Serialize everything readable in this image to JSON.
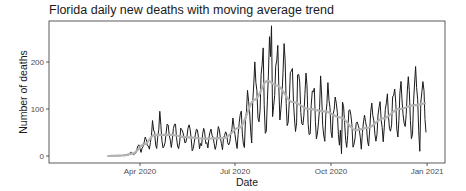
{
  "chart_data": {
    "type": "line",
    "title": "Florida daily new deaths with moving average trend",
    "xlabel": "Date",
    "ylabel": "Number of deaths",
    "x_ticks": [
      "Apr 2020",
      "Jul 2020",
      "Oct 2020",
      "Jan 2021"
    ],
    "y_ticks": [
      0,
      100,
      200
    ],
    "ylim": [
      -8,
      285
    ],
    "xlim": [
      "2020-02-10",
      "2021-01-18"
    ],
    "grid": false,
    "legend": "none",
    "series": [
      {
        "name": "Daily new deaths",
        "color": "#1a1a1a",
        "start": "2020-03-01",
        "end": "2020-12-31"
      },
      {
        "name": "Moving average",
        "color": "#b3b3b3",
        "start": "2020-03-01",
        "end": "2020-12-31"
      }
    ],
    "moving_average_knots": [
      {
        "date": "2020-03-01",
        "value": 0
      },
      {
        "date": "2020-03-15",
        "value": 1
      },
      {
        "date": "2020-03-25",
        "value": 5
      },
      {
        "date": "2020-04-05",
        "value": 25
      },
      {
        "date": "2020-04-15",
        "value": 45
      },
      {
        "date": "2020-05-01",
        "value": 45
      },
      {
        "date": "2020-05-15",
        "value": 40
      },
      {
        "date": "2020-06-01",
        "value": 37
      },
      {
        "date": "2020-06-20",
        "value": 38
      },
      {
        "date": "2020-07-05",
        "value": 60
      },
      {
        "date": "2020-07-20",
        "value": 120
      },
      {
        "date": "2020-08-01",
        "value": 160
      },
      {
        "date": "2020-08-10",
        "value": 150
      },
      {
        "date": "2020-08-25",
        "value": 115
      },
      {
        "date": "2020-09-10",
        "value": 100
      },
      {
        "date": "2020-09-25",
        "value": 95
      },
      {
        "date": "2020-10-10",
        "value": 82
      },
      {
        "date": "2020-10-25",
        "value": 55
      },
      {
        "date": "2020-11-05",
        "value": 60
      },
      {
        "date": "2020-11-20",
        "value": 80
      },
      {
        "date": "2020-12-05",
        "value": 100
      },
      {
        "date": "2020-12-20",
        "value": 108
      },
      {
        "date": "2020-12-31",
        "value": 112
      }
    ],
    "notable_points": [
      {
        "date": "2020-08-05",
        "value": 277,
        "note": "peak daily deaths"
      },
      {
        "date": "2020-07-28",
        "value": 230
      },
      {
        "date": "2020-04-20",
        "value": 95
      },
      {
        "date": "2020-10-11",
        "value": 5
      },
      {
        "date": "2020-12-25",
        "value": 10
      }
    ]
  },
  "colors": {
    "daily_line": "#1a1a1a",
    "moving_average": "#b3b3b3",
    "axis": "#333333"
  }
}
